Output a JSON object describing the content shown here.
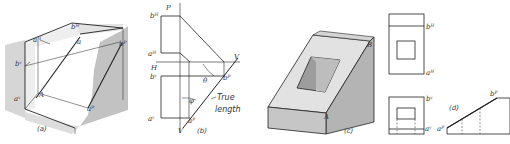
{
  "figure": {
    "panels": [
      {
        "id": "a",
        "caption": "(a)",
        "labels": {
          "a_h": "aᴴ",
          "b_h": "bᴴ",
          "b_v": "bᵛ",
          "a_v": "aᵛ",
          "a_lower": "a",
          "A": "A",
          "B": "B",
          "b_p": "bᴾ",
          "a_p": "aᴾ"
        }
      },
      {
        "id": "b",
        "caption": "(b)",
        "labels": {
          "P": "P",
          "b_h": "bᴴ",
          "a_h": "aᴴ",
          "H": "H",
          "V_top": "V",
          "b_v": "bᵛ",
          "theta": "θ",
          "b_p": "bᴾ",
          "phi": "φ",
          "true_length_1": "True",
          "true_length_2": "length",
          "a_v": "aᵛ",
          "a_p": "aᴾ",
          "V_bottom": "V"
        }
      },
      {
        "id": "c",
        "caption": "(c)",
        "labels": {
          "B": "B",
          "A": "A"
        }
      },
      {
        "id": "d",
        "caption": "(d)",
        "labels": {
          "b_h": "bᴴ",
          "a_h": "aᴴ",
          "b_v": "bᵛ",
          "a_v": "aᵛ",
          "a_p": "aᴾ",
          "b_p": "bᴾ"
        }
      }
    ]
  },
  "colors": {
    "line": "#222222",
    "shade_light": "#e6e6e6",
    "shade_mid": "#c8c8c8",
    "shade_dark": "#a9a9a9",
    "face": "#dcdcdc"
  }
}
